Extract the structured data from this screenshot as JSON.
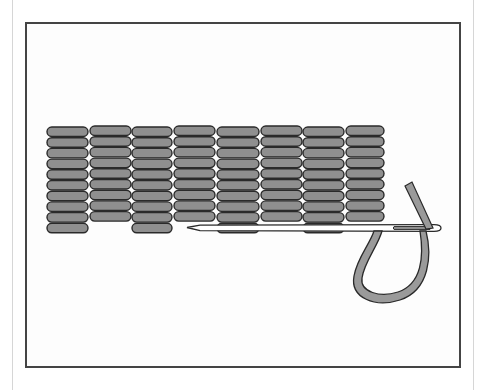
{
  "illustration": {
    "subject": "satin stitch embroidery rows with threaded needle",
    "colors": {
      "stitch_fill": "#8f8f8f",
      "stitch_outline": "#2a2a2a",
      "thread_fill": "#9a9a9a",
      "needle_fill": "#ffffff",
      "frame": "#444444",
      "outer_frame": "#d6d6d6"
    },
    "stitch_columns": [
      {
        "x": 47,
        "w": 41,
        "rows": 10,
        "top": 127
      },
      {
        "x": 90,
        "w": 41,
        "rows": 9,
        "top": 126
      },
      {
        "x": 132,
        "w": 40,
        "rows": 10,
        "top": 127
      },
      {
        "x": 174,
        "w": 41,
        "rows": 9,
        "top": 126
      },
      {
        "x": 217,
        "w": 42,
        "rows": 10,
        "top": 127
      },
      {
        "x": 261,
        "w": 41,
        "rows": 9,
        "top": 126
      },
      {
        "x": 303,
        "w": 41,
        "rows": 10,
        "top": 127
      },
      {
        "x": 346,
        "w": 38,
        "rows": 9,
        "top": 126
      }
    ],
    "row_pitch": 10.7,
    "stitch_height": 9.5
  }
}
